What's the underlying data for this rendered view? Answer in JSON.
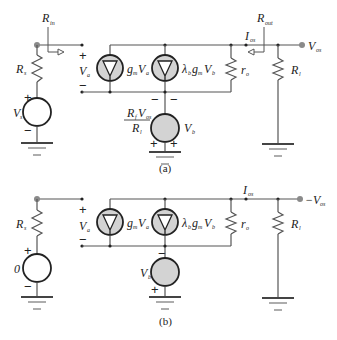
{
  "figure": {
    "panels": [
      {
        "id": "a",
        "caption": "(a)",
        "labels": {
          "rin": "R",
          "rin_sub": "in",
          "rout": "R",
          "rout_sub": "out",
          "rs": "R",
          "rs_sub": "s",
          "vs": "V",
          "vs_sub": "s",
          "va": "V",
          "va_sub": "a",
          "gm_va": "g",
          "gm_va_sub1": "m",
          "gm_va_v": "V",
          "gm_va_sub2": "a",
          "lambda_gm_vb": "λ",
          "lambda_sub": "b",
          "lambda_g": "g",
          "lambda_g_sub": "m",
          "lambda_v": "V",
          "lambda_v_sub": "b",
          "ro": "r",
          "ro_sub": "o",
          "rl": "R",
          "rl_sub": "l",
          "ios": "I",
          "ios_sub": "os",
          "vos": "V",
          "vos_sub": "os",
          "vb": "V",
          "vb_sub": "b",
          "vb_ctrl_num": "R",
          "vb_ctrl_num_sub": "f",
          "vb_ctrl_num_v": "V",
          "vb_ctrl_num_v_sub": "os",
          "vb_ctrl_den": "R",
          "vb_ctrl_den_sub": "l"
        },
        "signs": {
          "plus": "+",
          "minus": "−"
        }
      },
      {
        "id": "b",
        "caption": "(b)",
        "labels": {
          "rs": "R",
          "rs_sub": "s",
          "vs": "0",
          "va": "V",
          "va_sub": "a",
          "gm_va": "g",
          "gm_va_sub1": "m",
          "gm_va_v": "V",
          "gm_va_sub2": "a",
          "lambda_gm_vb": "λ",
          "lambda_sub": "b",
          "lambda_g": "g",
          "lambda_g_sub": "m",
          "lambda_v": "V",
          "lambda_v_sub": "b",
          "ro": "r",
          "ro_sub": "o",
          "rl": "R",
          "rl_sub": "l",
          "ios": "I",
          "ios_sub": "os",
          "vos": "−V",
          "vos_sub": "os",
          "vb": "V",
          "vb_sub": "b"
        },
        "signs": {
          "plus": "+",
          "minus": "−"
        }
      }
    ]
  }
}
